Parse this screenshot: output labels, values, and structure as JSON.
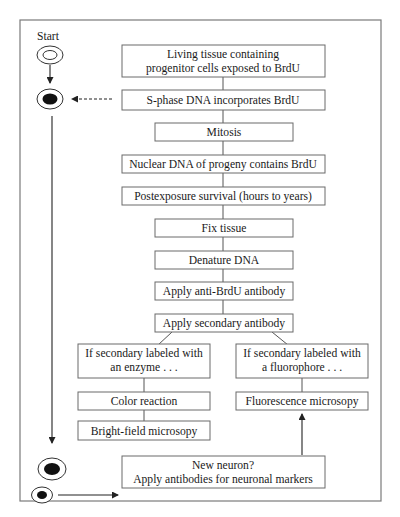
{
  "start_label": "Start",
  "steps": {
    "living_tissue": {
      "line1": "Living tissue containing",
      "line2": "progenitor cells exposed to BrdU"
    },
    "s_phase": "S-phase DNA incorporates BrdU",
    "mitosis": "Mitosis",
    "nuclear_dna": "Nuclear DNA of progeny contains BrdU",
    "postexposure": "Postexposure survival (hours to years)",
    "fix_tissue": "Fix tissue",
    "denature": "Denature DNA",
    "anti_brdu": "Apply anti-BrdU antibody",
    "secondary": "Apply secondary antibody",
    "enzyme_branch": {
      "line1": "If secondary labeled with",
      "line2": "an enzyme . . ."
    },
    "fluorophore_branch": {
      "line1": "If secondary labeled with",
      "line2": "a fluorophore . . ."
    },
    "color_reaction": "Color reaction",
    "bright_field": "Bright-field microsopy",
    "fluorescence": "Fluorescence microsopy",
    "new_neuron": {
      "line1": "New neuron?",
      "line2": "Apply antibodies for neuronal markers"
    }
  },
  "cell_icons": [
    {
      "name": "unlabeled-progenitor-cell",
      "nucleus": "empty"
    },
    {
      "name": "brdu-labeled-cell",
      "nucleus": "filled"
    },
    {
      "name": "labeled-progeny-cell",
      "nucleus": "filled"
    },
    {
      "name": "labeled-small-cell",
      "nucleus": "filled"
    }
  ]
}
